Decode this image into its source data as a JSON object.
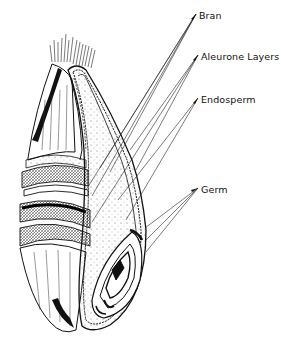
{
  "diagram": {
    "labels": [
      {
        "id": "bran",
        "text": "Bran",
        "x": 199,
        "y": 10
      },
      {
        "id": "aleurone",
        "text": "Aleurone Layers",
        "x": 201,
        "y": 51
      },
      {
        "id": "endosperm",
        "text": "Endosperm",
        "x": 201,
        "y": 94
      },
      {
        "id": "germ",
        "text": "Germ",
        "x": 201,
        "y": 184
      }
    ],
    "colors": {
      "ink": "#111111",
      "background": "#ffffff"
    }
  }
}
